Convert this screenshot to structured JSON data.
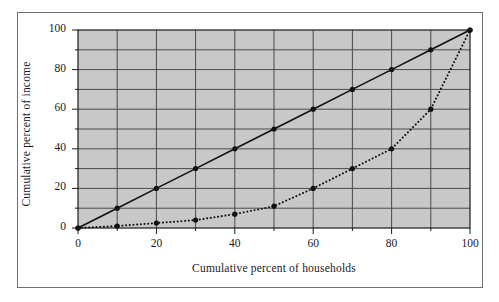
{
  "chart_data": {
    "type": "line",
    "title": "",
    "subtitle": "",
    "xlabel": "Cumulative percent of households",
    "ylabel": "Cumulative percent of income",
    "xlim": [
      0,
      100
    ],
    "ylim": [
      0,
      100
    ],
    "xticks": [
      0,
      20,
      40,
      60,
      80,
      100
    ],
    "yticks": [
      0,
      20,
      40,
      60,
      80,
      100
    ],
    "xtick_labels": [
      "0",
      "20",
      "40",
      "60",
      "80",
      "100"
    ],
    "ytick_labels": [
      "0",
      "20",
      "40",
      "60",
      "80",
      "100"
    ],
    "minor_tick_step": 10,
    "grid": true,
    "grid_step": 10,
    "legend": null,
    "legend_position": "none",
    "plot_background_color": "#c8c8c8",
    "grid_color": "#4a4a4a",
    "line_color": "#111111",
    "marker_color": "#111111",
    "x": [
      0,
      10,
      20,
      30,
      40,
      50,
      60,
      70,
      80,
      90,
      100
    ],
    "series": [
      {
        "name": "Line of perfect equality",
        "style": "solid",
        "values": [
          0,
          10,
          20,
          30,
          40,
          50,
          60,
          70,
          80,
          90,
          100
        ]
      },
      {
        "name": "Lorenz curve",
        "style": "dotted",
        "values": [
          0,
          1,
          2.5,
          4,
          7,
          11,
          20,
          30,
          40,
          60,
          100
        ]
      }
    ]
  }
}
